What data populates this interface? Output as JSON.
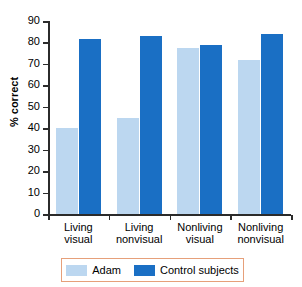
{
  "chart_data": {
    "type": "bar",
    "title": "",
    "xlabel": "",
    "ylabel": "% correct",
    "ylim": [
      0,
      90
    ],
    "ytick_step": 10,
    "yticks": [
      "90",
      "80",
      "70",
      "60",
      "50",
      "40",
      "30",
      "20",
      "10",
      "0"
    ],
    "grid": false,
    "legend_position": "bottom",
    "categories": [
      "Living visual",
      "Living nonvisual",
      "Nonliving visual",
      "Nonliving nonvisual"
    ],
    "category_lines": [
      [
        "Living",
        "visual"
      ],
      [
        "Living",
        "nonvisual"
      ],
      [
        "Nonliving",
        "visual"
      ],
      [
        "Nonliving",
        "nonvisual"
      ]
    ],
    "series": [
      {
        "name": "Adam",
        "color": "#bcd7f0",
        "values": [
          40,
          45,
          77.5,
          72
        ]
      },
      {
        "name": "Control subjects",
        "color": "#1a6fc4",
        "values": [
          81.5,
          83,
          79,
          84
        ]
      }
    ]
  },
  "legend": {
    "items": [
      {
        "label": "Adam",
        "color": "#bcd7f0"
      },
      {
        "label": "Control subjects",
        "color": "#1a6fc4"
      }
    ]
  },
  "colors": {
    "adam": "#bcd7f0",
    "control": "#1a6fc4",
    "axis": "#2b2b2b",
    "legend_border": "#e6a07a",
    "background": "#ffffff"
  }
}
